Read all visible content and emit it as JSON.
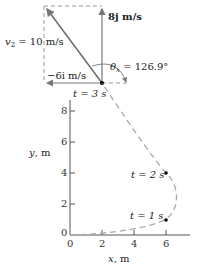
{
  "vector_diagram": {
    "v2_label": "v",
    "v2_sub": "2",
    "v2_value": " = 10 m/s",
    "vy_label": "8j m/s",
    "vx_label": "−6i m/s",
    "theta_label": "θ",
    "theta_sub": "x",
    "theta_value": " = 126.9°",
    "time_label": "t = 3 s"
  },
  "graph": {
    "x_axis_label": "x, m",
    "y_axis_label": "y, m",
    "x_ticks": [
      "0",
      "2",
      "4",
      "6"
    ],
    "y_ticks": [
      "0",
      "2",
      "4",
      "6",
      "8"
    ],
    "point_labels": [
      "t = 1 s",
      "t = 2 s"
    ]
  },
  "colors": {
    "line": "#555555",
    "dashed_path": "#aaaaaa",
    "arrow": "#777777",
    "point": "#000000"
  }
}
